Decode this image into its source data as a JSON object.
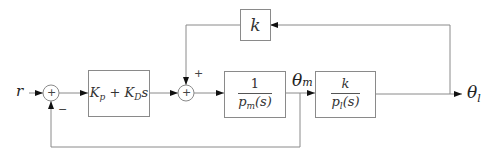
{
  "diagram": {
    "type": "block-diagram",
    "input": {
      "label": "r"
    },
    "blocks": [
      {
        "id": "controller",
        "label": "K_p + K_D s",
        "text_main": "K",
        "sub_p": "p",
        "plus": " + ",
        "text_kd": "K",
        "sub_d": "D",
        "s": "s"
      },
      {
        "id": "motor",
        "numerator": "1",
        "denominator": "p",
        "den_sub": "m",
        "den_arg": "(s)"
      },
      {
        "id": "load",
        "numerator": "k",
        "denominator": "p",
        "den_sub": "l",
        "den_arg": "(s)"
      },
      {
        "id": "coupling",
        "label": "k"
      }
    ],
    "summing_junctions": [
      {
        "id": "sum1",
        "symbol": "+",
        "signs": {
          "feedback": "−"
        }
      },
      {
        "id": "sum2",
        "symbol": "+",
        "signs": {
          "top": "+"
        }
      }
    ],
    "signals": {
      "theta_m": {
        "base": "θ",
        "sub": "m"
      },
      "theta_l": {
        "base": "θ",
        "sub": "l"
      }
    }
  }
}
